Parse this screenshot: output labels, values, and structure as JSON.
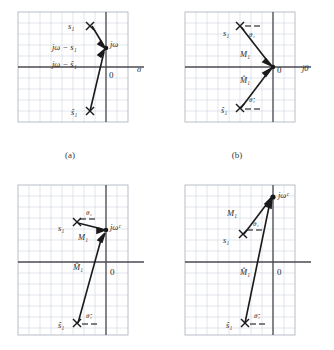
{
  "figure": {
    "panels": [
      {
        "id": "a",
        "caption": "(a)",
        "axis_labels": {
          "horizontal": "σ",
          "origin": "0",
          "point": "jω"
        },
        "markers": [
          {
            "name": "pole",
            "label": "s₁",
            "type": "x"
          },
          {
            "name": "conjugate-pole",
            "label": "ŝ₁",
            "type": "x"
          }
        ],
        "vectors": [
          {
            "label": "jω − s₁",
            "from": "s₁",
            "to": "jω"
          },
          {
            "label": "jω − ŝ₁",
            "from": "ŝ₁",
            "to": "jω"
          }
        ]
      },
      {
        "id": "b",
        "caption": "(b)",
        "axis_labels": {
          "horizontal": "j0",
          "origin": "0",
          "point": ""
        },
        "markers": [
          {
            "name": "pole",
            "label": "s₁",
            "type": "x"
          },
          {
            "name": "conjugate-pole",
            "label": "ŝ₁",
            "type": "x"
          }
        ],
        "vectors": [
          {
            "label": "M₁",
            "angle": "θ₁",
            "from": "s₁",
            "to": "0"
          },
          {
            "label": "M̂₁",
            "angle": "θ̂₁",
            "from": "ŝ₁",
            "to": "0"
          }
        ]
      },
      {
        "id": "c",
        "caption": "",
        "axis_labels": {
          "horizontal": "",
          "origin": "0",
          "point": "jωᶜ"
        },
        "markers": [
          {
            "name": "pole",
            "label": "s₁",
            "type": "x"
          },
          {
            "name": "conjugate-pole",
            "label": "ŝ₁",
            "type": "x"
          }
        ],
        "vectors": [
          {
            "label": "M₁",
            "angle": "θ₁",
            "from": "s₁",
            "to": "jωᶜ"
          },
          {
            "label": "M̂₁",
            "angle": "θ̂₁",
            "from": "ŝ₁",
            "to": "jωᶜ"
          }
        ]
      },
      {
        "id": "d",
        "caption": "",
        "axis_labels": {
          "horizontal": "",
          "origin": "0",
          "point": "jωᶜ"
        },
        "markers": [
          {
            "name": "pole",
            "label": "s₁",
            "type": "x"
          },
          {
            "name": "conjugate-pole",
            "label": "ŝ₁",
            "type": "x"
          }
        ],
        "vectors": [
          {
            "label": "M₁",
            "angle": "θ₁",
            "from": "s₁",
            "to": "jωᶜ"
          },
          {
            "label": "M̂₁",
            "angle": "θ̂₁",
            "from": "ŝ₁",
            "to": "jωᶜ"
          }
        ]
      }
    ],
    "colors": {
      "grid": "#cfd3dd",
      "axis": "#4a4a52",
      "vector": "#1a1a1a",
      "background": "#ffffff"
    }
  }
}
